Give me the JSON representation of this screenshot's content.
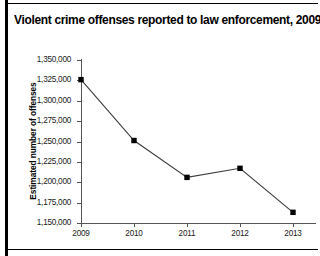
{
  "chart_title": "Violent crime offenses reported to law enforcement, 2009–13",
  "axes": {
    "y_title": "Estimated number of offenses",
    "x_title": ""
  },
  "chart_data": {
    "type": "line",
    "title": "Violent crime offenses reported to law enforcement, 2009–13",
    "xlabel": "",
    "ylabel": "Estimated number of offenses",
    "categories": [
      "2009",
      "2010",
      "2011",
      "2012",
      "2013"
    ],
    "values": [
      1325900,
      1251200,
      1206000,
      1217100,
      1163100
    ],
    "ylim": [
      1150000,
      1350000
    ],
    "ytick_values": [
      1150000,
      1175000,
      1200000,
      1225000,
      1250000,
      1275000,
      1300000,
      1325000,
      1350000
    ],
    "ytick_labels": [
      "1,150,000",
      "1,175,000",
      "1,200,000",
      "1,225,000",
      "1,250,000",
      "1,275,000",
      "1,300,000",
      "1,325,000",
      "1,350,000"
    ],
    "xtick_labels": [
      "2009",
      "2010",
      "2011",
      "2012",
      "2013"
    ],
    "series": [
      {
        "name": "Estimated number of offenses",
        "values": [
          1325900,
          1251200,
          1206000,
          1217100,
          1163100
        ]
      }
    ],
    "grid": false,
    "legend": "none",
    "marker": "square",
    "marker_color": "#000000",
    "line_color": "#3c3c3c"
  },
  "colors": {
    "line": "#3c3c3c",
    "marker": "#000000",
    "axis": "#555555",
    "text": "#000000",
    "background": "#ffffff"
  }
}
